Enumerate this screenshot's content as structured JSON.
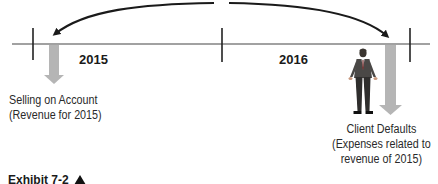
{
  "diagram": {
    "timeline": {
      "periods": [
        {
          "label": "2015"
        },
        {
          "label": "2016"
        }
      ]
    },
    "events": {
      "left": {
        "title": "Selling on Account",
        "subtitle": "(Revenue for 2015)"
      },
      "right": {
        "title": "Client Defaults",
        "subtitle_line1": "(Expenses related to",
        "subtitle_line2": "revenue of 2015)"
      }
    },
    "caption": {
      "text": "Exhibit 7-2"
    },
    "colors": {
      "line": "#333333",
      "arrow_fill": "#b5b5b5",
      "arc": "#1a1a1a"
    },
    "icons": {
      "person": "businessman-figure",
      "caption_marker": "triangle-up"
    }
  }
}
